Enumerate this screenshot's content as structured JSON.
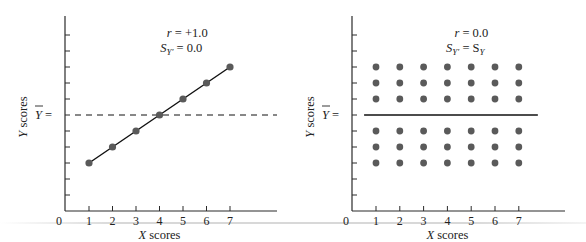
{
  "chart_data": [
    {
      "type": "scatter",
      "panel": "left",
      "title": "",
      "annotation": {
        "line1": "r = +1.0",
        "line2_main": "S",
        "line2_sub": "Y′",
        "line2_rest": " = 0.0"
      },
      "xlabel": "X scores",
      "ylabel": "Y scores",
      "ymean_label": "Y =",
      "x_ticks": [
        "0",
        "1",
        "2",
        "3",
        "4",
        "5",
        "6",
        "7"
      ],
      "y_ticks_count": 11,
      "points": [
        {
          "x": 1,
          "y": 3
        },
        {
          "x": 2,
          "y": 4
        },
        {
          "x": 3,
          "y": 5
        },
        {
          "x": 4,
          "y": 6
        },
        {
          "x": 5,
          "y": 7
        },
        {
          "x": 6,
          "y": 8
        },
        {
          "x": 7,
          "y": 9
        }
      ],
      "regression_line": {
        "from": {
          "x": 1,
          "y": 3
        },
        "to": {
          "x": 7,
          "y": 9
        },
        "style": "solid"
      },
      "mean_line": {
        "y": 6,
        "style": "dashed"
      },
      "xlim": [
        0,
        9
      ],
      "ylim": [
        0,
        11.5
      ],
      "grid": false,
      "r": 1.0,
      "S_Y_prime": 0.0
    },
    {
      "type": "scatter",
      "panel": "right",
      "title": "",
      "annotation": {
        "line1": "r = 0.0",
        "line2_main": "S",
        "line2_sub": "Y′",
        "line2_rest": " = S",
        "line2_sub2": "Y"
      },
      "xlabel": "X scores",
      "ylabel": "Y scores",
      "ymean_label": "Y =",
      "x_ticks": [
        "0",
        "1",
        "2",
        "3",
        "4",
        "5",
        "6",
        "7"
      ],
      "y_ticks_count": 11,
      "points_rows_y": [
        9,
        8,
        7,
        5,
        4,
        3
      ],
      "points_cols_x": [
        1,
        2,
        3,
        4,
        5,
        6,
        7
      ],
      "regression_line": {
        "y": 6,
        "style": "solid",
        "from_x": 0.5,
        "to_x": 7.8
      },
      "xlim": [
        0,
        9
      ],
      "ylim": [
        0,
        11.5
      ],
      "grid": false,
      "r": 0.0,
      "S_Y_prime": "S_Y"
    }
  ],
  "colors": {
    "axis": "#2a2a2a",
    "point": "#5a5a5a",
    "line": "#111111",
    "text": "#222222"
  }
}
